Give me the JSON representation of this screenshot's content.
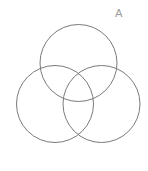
{
  "diagram": {
    "type": "venn",
    "label": "A",
    "stroke_color": "#7a7a7a",
    "label_color": "#9a9a9a",
    "label_position": {
      "x": 115,
      "y": 8
    },
    "circles": [
      {
        "name": "top",
        "cx": 78.5,
        "cy": 63,
        "r": 38.5
      },
      {
        "name": "left",
        "cx": 55,
        "cy": 104,
        "r": 38.5
      },
      {
        "name": "right",
        "cx": 101.5,
        "cy": 104,
        "r": 38.5
      }
    ]
  }
}
